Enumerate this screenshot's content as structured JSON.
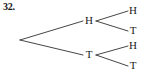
{
  "figure": {
    "problem_number": "32.",
    "width": 148,
    "height": 77,
    "background_color": "#ffffff",
    "line_color": "#33302e",
    "text_color": "#1a1a1a"
  },
  "diagram": {
    "type": "tree",
    "root": {
      "x": 20,
      "y": 40
    },
    "level1": [
      {
        "id": "h1",
        "label": "H",
        "x": 89,
        "y": 21
      },
      {
        "id": "t1",
        "label": "T",
        "x": 89,
        "y": 55
      }
    ],
    "level2": [
      {
        "id": "h1-h",
        "label": "H",
        "x": 133,
        "y": 11,
        "parent": "h1"
      },
      {
        "id": "h1-t",
        "label": "T",
        "x": 133,
        "y": 31,
        "parent": "h1"
      },
      {
        "id": "t1-h",
        "label": "H",
        "x": 133,
        "y": 46,
        "parent": "t1"
      },
      {
        "id": "t1-t",
        "label": "T",
        "x": 133,
        "y": 66,
        "parent": "t1"
      }
    ],
    "edges": [
      {
        "from": "root",
        "to": "h1",
        "x1": 20,
        "y1": 40,
        "x2": 83,
        "y2": 21
      },
      {
        "from": "root",
        "to": "t1",
        "x1": 20,
        "y1": 40,
        "x2": 83,
        "y2": 55
      },
      {
        "from": "h1",
        "to": "h1-h",
        "x1": 96,
        "y1": 21,
        "x2": 128,
        "y2": 11
      },
      {
        "from": "h1",
        "to": "h1-t",
        "x1": 96,
        "y1": 21,
        "x2": 128,
        "y2": 31
      },
      {
        "from": "t1",
        "to": "t1-h",
        "x1": 96,
        "y1": 55,
        "x2": 128,
        "y2": 46
      },
      {
        "from": "t1",
        "to": "t1-t",
        "x1": 96,
        "y1": 55,
        "x2": 128,
        "y2": 66
      }
    ]
  }
}
